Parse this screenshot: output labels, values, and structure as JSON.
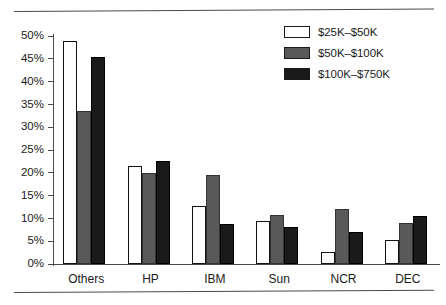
{
  "chart_data": {
    "type": "bar",
    "title": "",
    "subtitle": "",
    "xlabel": "",
    "ylabel": "",
    "ylim": [
      0,
      50
    ],
    "ytick_labels": [
      "50%",
      "45%",
      "40%",
      "35%",
      "30%",
      "25%",
      "20%",
      "15%",
      "10%",
      "5%",
      "0%"
    ],
    "ytick_values": [
      50,
      45,
      40,
      35,
      30,
      25,
      20,
      15,
      10,
      5,
      0
    ],
    "grid": false,
    "legend_position": "top-right",
    "categories": [
      "Others",
      "HP",
      "IBM",
      "Sun",
      "NCR",
      "DEC"
    ],
    "series": [
      {
        "name": "$25K–$50K",
        "color": "#ffffff",
        "values": [
          49.0,
          21.5,
          12.8,
          9.5,
          2.7,
          5.3
        ]
      },
      {
        "name": "$50K–$100K",
        "color": "#595959",
        "values": [
          33.5,
          20.0,
          19.5,
          10.7,
          12.0,
          9.0
        ]
      },
      {
        "name": "$100K–$750K",
        "color": "#1a1a1a",
        "values": [
          45.5,
          22.5,
          8.7,
          8.2,
          7.0,
          10.5
        ]
      }
    ]
  },
  "legend": {
    "items": [
      {
        "label": "$25K–$50K",
        "swatch": "white-swatch"
      },
      {
        "label": "$50K–$100K",
        "swatch": "gray-swatch"
      },
      {
        "label": "$100K–$750K",
        "swatch": "black-swatch"
      }
    ]
  }
}
